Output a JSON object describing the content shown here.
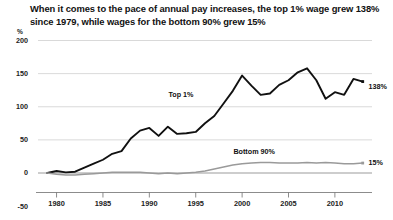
{
  "chart_data": {
    "type": "line",
    "title": "When it comes to the pace of annual pay increases, the top 1% wage grew 138% since 1979, while wages for the bottom 90% grew 15%",
    "xlabel": "",
    "ylabel": "%",
    "ylim": [
      -50,
      200
    ],
    "xlim": [
      1978,
      2014
    ],
    "grid": true,
    "legend_position": "inline-annotation",
    "ytick_labels": [
      "200",
      "150",
      "100",
      "50",
      "0",
      "-50"
    ],
    "ytick_values": [
      200,
      150,
      100,
      50,
      0,
      -50
    ],
    "xtick_labels": [
      "1980",
      "1985",
      "1990",
      "1995",
      "2000",
      "2005",
      "2010"
    ],
    "xtick_values": [
      1980,
      1985,
      1990,
      1995,
      2000,
      2005,
      2010
    ],
    "annotations": [
      {
        "text": "Top 1%",
        "x": 1994,
        "y": 118
      },
      {
        "text": "Bottom 90%",
        "x": 2001,
        "y": 33
      },
      {
        "text": "138%",
        "x": 2013.4,
        "y": 131
      },
      {
        "text": "15%",
        "x": 2013.4,
        "y": 15
      }
    ],
    "series": [
      {
        "name": "Top 1%",
        "color": "#111111",
        "end_value": 138,
        "end_label": "138%",
        "x": [
          1979,
          1980,
          1981,
          1982,
          1983,
          1984,
          1985,
          1986,
          1987,
          1988,
          1989,
          1990,
          1991,
          1992,
          1993,
          1994,
          1995,
          1996,
          1997,
          1998,
          1999,
          2000,
          2001,
          2002,
          2003,
          2004,
          2005,
          2006,
          2007,
          2008,
          2009,
          2010,
          2011,
          2012,
          2013
        ],
        "values": [
          0,
          3,
          1,
          2,
          8,
          14,
          20,
          29,
          33,
          52,
          64,
          68,
          56,
          70,
          59,
          60,
          62,
          75,
          86,
          105,
          124,
          147,
          132,
          118,
          120,
          133,
          140,
          152,
          158,
          140,
          112,
          122,
          118,
          142,
          138
        ]
      },
      {
        "name": "Bottom 90%",
        "color": "#9a9a9a",
        "end_value": 15,
        "end_label": "15%",
        "x": [
          1979,
          1980,
          1981,
          1982,
          1983,
          1984,
          1985,
          1986,
          1987,
          1988,
          1989,
          1990,
          1991,
          1992,
          1993,
          1994,
          1995,
          1996,
          1997,
          1998,
          1999,
          2000,
          2001,
          2002,
          2003,
          2004,
          2005,
          2006,
          2007,
          2008,
          2009,
          2010,
          2011,
          2012,
          2013
        ],
        "values": [
          0,
          -2,
          -3,
          -3,
          -2,
          -1,
          0,
          1,
          1,
          1,
          1,
          0,
          -1,
          0,
          -1,
          0,
          1,
          3,
          6,
          9,
          12,
          14,
          15,
          16,
          16,
          15,
          15,
          15,
          16,
          15,
          16,
          15,
          14,
          14,
          15
        ]
      }
    ]
  }
}
